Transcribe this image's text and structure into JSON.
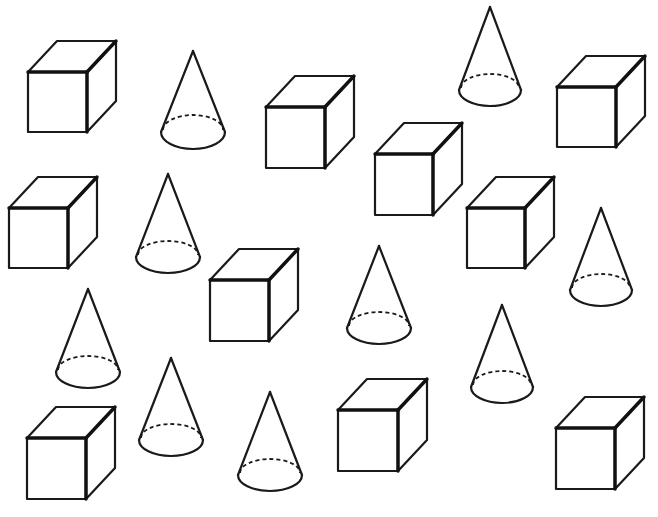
{
  "worksheet": {
    "background": "#ffffff",
    "stroke_color": "#1a1a1a",
    "cube_depth": {
      "dx": 29,
      "dy": -31
    },
    "cubes": [
      {
        "x": 28,
        "y": 72,
        "w": 59,
        "h": 60
      },
      {
        "x": 266,
        "y": 107,
        "w": 59,
        "h": 61
      },
      {
        "x": 375,
        "y": 154,
        "w": 58,
        "h": 61
      },
      {
        "x": 557,
        "y": 87,
        "w": 59,
        "h": 60
      },
      {
        "x": 9,
        "y": 208,
        "w": 59,
        "h": 60
      },
      {
        "x": 210,
        "y": 280,
        "w": 59,
        "h": 61
      },
      {
        "x": 467,
        "y": 208,
        "w": 58,
        "h": 60
      },
      {
        "x": 27,
        "y": 438,
        "w": 59,
        "h": 61
      },
      {
        "x": 338,
        "y": 410,
        "w": 60,
        "h": 61
      },
      {
        "x": 556,
        "y": 428,
        "w": 59,
        "h": 61
      }
    ],
    "cones": [
      {
        "cx": 193,
        "apex_y": 51,
        "base_y": 132,
        "rx": 32,
        "ry": 17
      },
      {
        "cx": 490,
        "apex_y": 7,
        "base_y": 90,
        "rx": 31,
        "ry": 16
      },
      {
        "cx": 168,
        "apex_y": 174,
        "base_y": 257,
        "rx": 32,
        "ry": 16
      },
      {
        "cx": 601,
        "apex_y": 208,
        "base_y": 290,
        "rx": 31,
        "ry": 16
      },
      {
        "cx": 379,
        "apex_y": 246,
        "base_y": 328,
        "rx": 32,
        "ry": 16
      },
      {
        "cx": 88,
        "apex_y": 289,
        "base_y": 372,
        "rx": 32,
        "ry": 16
      },
      {
        "cx": 502,
        "apex_y": 305,
        "base_y": 387,
        "rx": 31,
        "ry": 16
      },
      {
        "cx": 171,
        "apex_y": 358,
        "base_y": 440,
        "rx": 32,
        "ry": 16
      },
      {
        "cx": 270,
        "apex_y": 392,
        "base_y": 475,
        "rx": 32,
        "ry": 16
      }
    ],
    "counts": {
      "cubes": 10,
      "cones": 9
    }
  }
}
